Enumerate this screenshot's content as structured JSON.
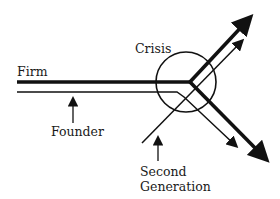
{
  "diagram": {
    "type": "flow-diagram",
    "labels": {
      "firm": "Firm",
      "crisis": "Crisis",
      "founder": "Founder",
      "second_generation_line1": "Second",
      "second_generation_line2": "Generation"
    },
    "elements": [
      {
        "id": "firm-line",
        "kind": "thick-line",
        "label": "Firm"
      },
      {
        "id": "founder-line",
        "kind": "thin-line",
        "label": "Founder"
      },
      {
        "id": "second-generation-line",
        "kind": "thin-line",
        "label": "Second Generation"
      },
      {
        "id": "crisis-circle",
        "kind": "circle",
        "label": "Crisis"
      }
    ],
    "colors": {
      "stroke": "#111111",
      "text": "#1a1a1a",
      "background": "#ffffff"
    }
  }
}
